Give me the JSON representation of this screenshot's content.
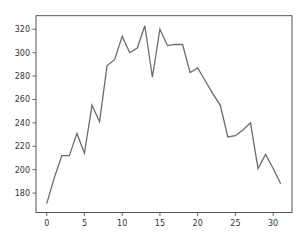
{
  "chart_data": {
    "type": "line",
    "title": "",
    "xlabel": "",
    "ylabel": "",
    "x": [
      0,
      1,
      2,
      3,
      4,
      5,
      6,
      7,
      8,
      9,
      10,
      11,
      12,
      13,
      14,
      15,
      16,
      17,
      18,
      19,
      20,
      21,
      22,
      23,
      24,
      25,
      26,
      27,
      28,
      29,
      30,
      31
    ],
    "series": [
      {
        "name": "series",
        "color": "#6b6b6b",
        "values": [
          171,
          193,
          212,
          212,
          231,
          214,
          255,
          241,
          289,
          294,
          314,
          300,
          304,
          323,
          279,
          320,
          306,
          307,
          307,
          283,
          287,
          276,
          265,
          255,
          228,
          229,
          234,
          240,
          201,
          213,
          201,
          188
        ]
      }
    ],
    "xlim": [
      -1.42,
      32.5
    ],
    "ylim": [
      163.4,
      331.6
    ],
    "xticks": [
      0,
      5,
      10,
      15,
      20,
      25,
      30
    ],
    "yticks": [
      180,
      200,
      220,
      240,
      260,
      280,
      300,
      320
    ],
    "grid": false,
    "legend": null
  },
  "layout": {
    "axes": {
      "left": 36,
      "top": 15.7,
      "right": 292,
      "bottom": 212.5
    },
    "axis_color": "#444444",
    "line_width": 1.3
  }
}
